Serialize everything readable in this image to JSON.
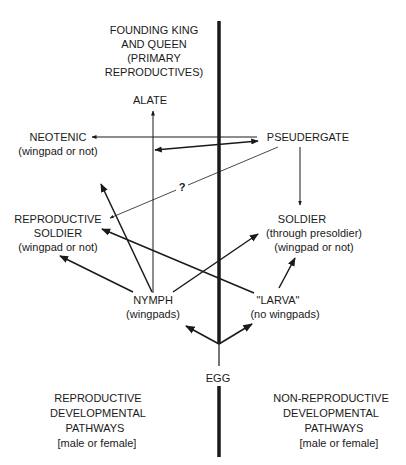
{
  "diagram": {
    "title": {
      "lines": [
        "FOUNDING KING",
        "AND QUEEN",
        "(PRIMARY",
        "REPRODUCTIVES)"
      ]
    },
    "nodes": {
      "alate": {
        "lines": [
          "ALATE"
        ]
      },
      "neotenic": {
        "lines": [
          "NEOTENIC",
          "(wingpad or not)"
        ]
      },
      "pseudergate": {
        "lines": [
          "PSEUDERGATE"
        ]
      },
      "reproductive_soldier": {
        "lines": [
          "REPRODUCTIVE",
          "SOLDIER",
          "(wingpad or not)"
        ]
      },
      "soldier": {
        "lines": [
          "SOLDIER",
          "(through presoldier)",
          "(wingpad or not)"
        ]
      },
      "nymph": {
        "lines": [
          "NYMPH",
          "(wingpads)"
        ]
      },
      "larva": {
        "lines": [
          "\"LARVA\"",
          "(no wingpads)"
        ]
      },
      "egg": {
        "lines": [
          "EGG"
        ]
      }
    },
    "uncertain_marker": "?",
    "footer": {
      "left": [
        "REPRODUCTIVE",
        "DEVELOPMENTAL",
        "PATHWAYS",
        "[male or female]"
      ],
      "right": [
        "NON-REPRODUCTIVE",
        "DEVELOPMENTAL",
        "PATHWAYS",
        "[male or female]"
      ]
    },
    "edges": [
      {
        "from": "egg",
        "to": "nymph"
      },
      {
        "from": "egg",
        "to": "larva"
      },
      {
        "from": "nymph",
        "to": "alate"
      },
      {
        "from": "nymph",
        "to": "neotenic"
      },
      {
        "from": "nymph",
        "to": "reproductive_soldier"
      },
      {
        "from": "nymph",
        "to": "soldier"
      },
      {
        "from": "larva",
        "to": "reproductive_soldier"
      },
      {
        "from": "larva",
        "to": "soldier"
      },
      {
        "from": "pseudergate",
        "to": "neotenic"
      },
      {
        "from": "pseudergate",
        "to": "nymph",
        "bidirectional": true
      },
      {
        "from": "pseudergate",
        "to": "soldier"
      },
      {
        "from": "pseudergate",
        "to": "reproductive_soldier",
        "uncertain": true
      }
    ],
    "colors": {
      "ink": "#1a1a1a",
      "background": "#ffffff"
    }
  }
}
